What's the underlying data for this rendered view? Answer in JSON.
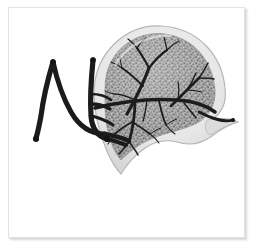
{
  "figure": {
    "title": "Grayscale anatomical illustration of a lobed organ with vascular tree",
    "background_color": "#ffffff",
    "card": {
      "border_color": "#e2e2e2",
      "shadow_color": "rgba(120,120,120,0.30)",
      "fill_color": "#ffffff"
    },
    "palette": {
      "capsule_outer": "#e8e8e8",
      "capsule_edge": "#b9b9b9",
      "parenchyma_fill": "#9d9d9d",
      "parenchyma_stipple_dark": "#5c5c5c",
      "parenchyma_stipple_light": "#c9c9c9",
      "vessel_dark": "#1c1c1c",
      "vessel_mid": "#2a2a2a",
      "highlight": "#f2f2f2"
    },
    "parts": [
      {
        "name": "organ-body",
        "label": "Lobed organ body",
        "shape": "leaf-like lobe with tapering caudal tail"
      },
      {
        "name": "outer-capsule",
        "label": "Translucent outer capsule"
      },
      {
        "name": "parenchyma",
        "label": "Stippled granular parenchyma"
      },
      {
        "name": "upper-vascular-tree",
        "label": "Upper dendritic vascular tree"
      },
      {
        "name": "lower-vascular-tree",
        "label": "Lower dendritic vascular tree"
      },
      {
        "name": "central-vessel-trunk",
        "label": "Central horizontal vessel trunk"
      },
      {
        "name": "pedicle-vessel-left",
        "label": "Left pedicle vessel with bulbous terminus"
      },
      {
        "name": "pedicle-vessel-right",
        "label": "Right pedicle vessel with bulbous terminus"
      },
      {
        "name": "caudal-tail-vessel",
        "label": "Caudal tail vessel"
      }
    ]
  }
}
